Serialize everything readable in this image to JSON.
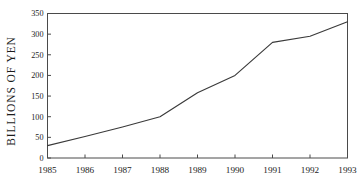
{
  "chart_data": {
    "type": "line",
    "title": "",
    "subtitle": "",
    "xlabel": "",
    "ylabel": "BILLIONS OF YEN",
    "categories": [
      "1985",
      "1986",
      "1987",
      "1988",
      "1989",
      "1990",
      "1991",
      "1992",
      "1993"
    ],
    "x": [
      1985,
      1986,
      1987,
      1988,
      1989,
      1990,
      1991,
      1992,
      1993
    ],
    "values": [
      30,
      52,
      75,
      100,
      158,
      200,
      280,
      295,
      330
    ],
    "series": [
      {
        "name": "",
        "values": [
          30,
          52,
          75,
          100,
          158,
          200,
          280,
          295,
          330
        ],
        "color": "#3a3a3a"
      }
    ],
    "ylim": [
      0,
      350
    ],
    "xlim": [
      1985,
      1993
    ],
    "yticks": [
      0,
      50,
      100,
      150,
      200,
      250,
      300,
      350
    ],
    "ytick_labels": [
      "0",
      "50",
      "100",
      "150",
      "200",
      "250",
      "300",
      "350"
    ],
    "xticks": [
      1985,
      1986,
      1987,
      1988,
      1989,
      1990,
      1991,
      1992,
      1993
    ],
    "xtick_labels": [
      "1985",
      "1986",
      "1987",
      "1988",
      "1989",
      "1990",
      "1991",
      "1992",
      "1993"
    ],
    "grid": false,
    "legend": false,
    "legend_position": "none",
    "frame_color": "#4a4a4a",
    "background_color": "#ffffff",
    "annotations": []
  }
}
